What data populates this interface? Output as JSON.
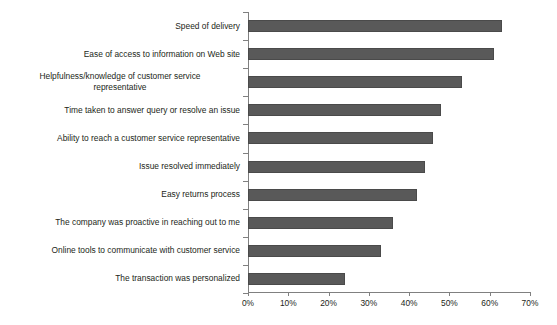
{
  "chart_data": {
    "type": "bar",
    "orientation": "horizontal",
    "title": "",
    "subtitle": "",
    "xlabel": "",
    "ylabel": "",
    "xlim": [
      0,
      70
    ],
    "xtick_labels": [
      "0%",
      "10%",
      "20%",
      "30%",
      "40%",
      "50%",
      "60%",
      "70%"
    ],
    "xtick_values": [
      0,
      10,
      20,
      30,
      40,
      50,
      60,
      70
    ],
    "grid": false,
    "legend": false,
    "value_suffix": "%",
    "bar_color": "#595959",
    "bar_edge_color": "#4a4a4a",
    "axis_color": "#808080",
    "text_color": "#231f20",
    "background_color": "#ffffff",
    "categories": [
      "Speed of delivery",
      "Ease of access to information on Web site",
      "Helpfulness/knowledge of customer service representative",
      "Time taken to answer query or resolve an issue",
      "Ability to reach a customer service representative",
      "Issue resolved immediately",
      "Easy returns process",
      "The company was proactive in reaching out to me",
      "Online tools to communicate with customer service",
      "The transaction was personalized"
    ],
    "category_lines": [
      [
        "Speed of delivery"
      ],
      [
        "Ease of access to information on Web site"
      ],
      [
        "Helpfulness/knowledge of customer service",
        "representative"
      ],
      [
        "Time taken to answer query or resolve an issue"
      ],
      [
        "Ability to reach a customer service representative"
      ],
      [
        "Issue resolved immediately"
      ],
      [
        "Easy returns process"
      ],
      [
        "The company was proactive in reaching out to me"
      ],
      [
        "Online tools to communicate with customer service"
      ],
      [
        "The transaction was personalized"
      ]
    ],
    "values": [
      63,
      61,
      53,
      48,
      46,
      44,
      42,
      36,
      33,
      24
    ]
  }
}
